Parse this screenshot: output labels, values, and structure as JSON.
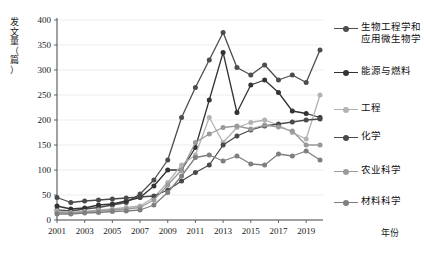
{
  "axes": {
    "y_title": "发文量（篇）",
    "y_title_chars": [
      "发",
      "文",
      "量",
      "（",
      "篇",
      "）"
    ],
    "x_title": "年份",
    "y_ticks": [
      "0",
      "50",
      "100",
      "150",
      "200",
      "250",
      "300",
      "350",
      "400"
    ],
    "x_ticks": [
      "2001",
      "2003",
      "2005",
      "2007",
      "2009",
      "2011",
      "2013",
      "2015",
      "2017",
      "2019"
    ]
  },
  "legend": {
    "items": [
      {
        "label": "生物工程学和",
        "label2": "应用微生物学",
        "color": "#4d4d4d",
        "name": "legend-bioengineering"
      },
      {
        "label": "能源与燃料",
        "label2": "",
        "color": "#333333",
        "name": "legend-energy-fuel"
      },
      {
        "label": "工程",
        "label2": "",
        "color": "#b3b3b3",
        "name": "legend-engineering"
      },
      {
        "label": "化学",
        "label2": "",
        "color": "#4a4a4a",
        "name": "legend-chemistry"
      },
      {
        "label": "农业科学",
        "label2": "",
        "color": "#9a9a9a",
        "name": "legend-agriculture"
      },
      {
        "label": "材料科学",
        "label2": "",
        "color": "#7f7f7f",
        "name": "legend-materials"
      }
    ]
  },
  "chart_data": {
    "type": "line",
    "title": "",
    "xlabel": "年份",
    "ylabel": "发文量（篇）",
    "ylim": [
      0,
      400
    ],
    "ytick_step": 50,
    "grid": "horizontal",
    "legend_position": "right",
    "x": [
      2001,
      2002,
      2003,
      2004,
      2005,
      2006,
      2007,
      2008,
      2009,
      2010,
      2011,
      2012,
      2013,
      2014,
      2015,
      2016,
      2017,
      2018,
      2019,
      2020
    ],
    "series": [
      {
        "name": "生物工程学和应用微生物学",
        "color": "#4d4d4d",
        "values": [
          20,
          18,
          22,
          25,
          30,
          35,
          52,
          80,
          120,
          205,
          265,
          320,
          375,
          305,
          290,
          310,
          280,
          290,
          275,
          340
        ]
      },
      {
        "name": "能源与燃料",
        "color": "#333333",
        "values": [
          28,
          22,
          24,
          30,
          32,
          38,
          45,
          68,
          100,
          100,
          145,
          240,
          335,
          215,
          270,
          280,
          255,
          218,
          213,
          205
        ]
      },
      {
        "name": "工程",
        "color": "#b3b3b3",
        "values": [
          18,
          15,
          17,
          20,
          22,
          25,
          28,
          45,
          75,
          110,
          130,
          205,
          155,
          185,
          195,
          200,
          190,
          175,
          162,
          250
        ]
      },
      {
        "name": "化学",
        "color": "#4a4a4a",
        "values": [
          45,
          35,
          38,
          40,
          42,
          44,
          46,
          48,
          60,
          78,
          95,
          110,
          150,
          168,
          180,
          188,
          192,
          196,
          200,
          202
        ]
      },
      {
        "name": "农业科学",
        "color": "#9a9a9a",
        "values": [
          15,
          14,
          16,
          18,
          20,
          22,
          25,
          40,
          70,
          100,
          155,
          172,
          185,
          188,
          182,
          190,
          186,
          178,
          150,
          150
        ]
      },
      {
        "name": "材料科学",
        "color": "#7f7f7f",
        "values": [
          12,
          12,
          14,
          15,
          17,
          18,
          20,
          30,
          55,
          88,
          125,
          130,
          118,
          128,
          112,
          110,
          132,
          128,
          138,
          120
        ]
      }
    ]
  }
}
